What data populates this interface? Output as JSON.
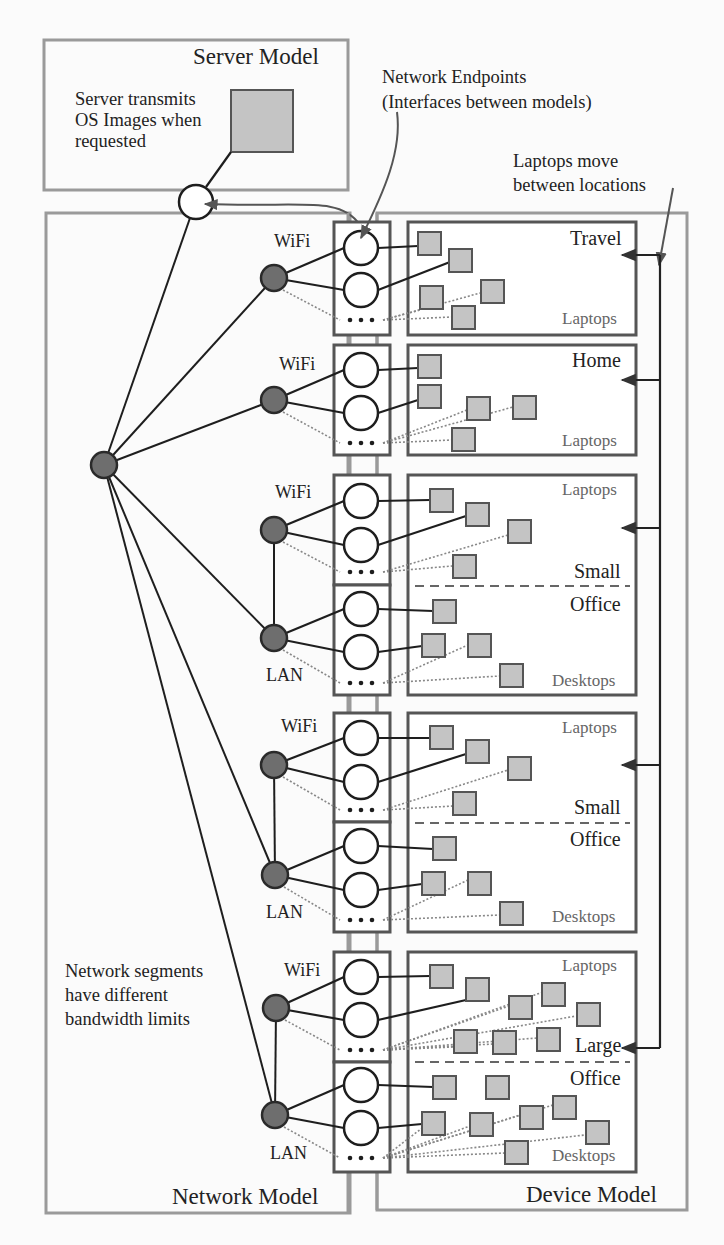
{
  "models": {
    "server": {
      "title": "Server Model",
      "note": [
        "Server transmits",
        "OS Images when",
        "requested"
      ]
    },
    "network": {
      "title": "Network Model",
      "note": [
        "Network segments",
        "have different",
        "bandwidth limits"
      ]
    },
    "device": {
      "title": "Device Model"
    }
  },
  "annotations": {
    "endpoints": [
      "Network Endpoints",
      "(Interfaces between models)"
    ],
    "laptops_move": [
      "Laptops move",
      "between locations"
    ]
  },
  "segment_labels": {
    "wifi": "WiFi",
    "lan": "LAN"
  },
  "locations": [
    {
      "name": "Travel",
      "categories": [
        "Laptops"
      ],
      "segments": [
        "WiFi"
      ]
    },
    {
      "name": "Home",
      "categories": [
        "Laptops"
      ],
      "segments": [
        "WiFi"
      ]
    },
    {
      "name_lines": [
        "Small",
        "Office"
      ],
      "categories": [
        "Laptops",
        "Desktops"
      ],
      "segments": [
        "WiFi",
        "LAN"
      ]
    },
    {
      "name_lines": [
        "Small",
        "Office"
      ],
      "categories": [
        "Laptops",
        "Desktops"
      ],
      "segments": [
        "WiFi",
        "LAN"
      ]
    },
    {
      "name_lines": [
        "Large",
        "Office"
      ],
      "categories": [
        "Laptops",
        "Desktops"
      ],
      "segments": [
        "WiFi",
        "LAN"
      ]
    }
  ],
  "labels": {
    "travel": "Travel",
    "home": "Home",
    "small": "Small",
    "office": "Office",
    "large": "Large",
    "laptops": "Laptops",
    "desktops": "Desktops",
    "ellipsis": "• • •"
  },
  "colors": {
    "frame": "#9a9a9a",
    "box": "#555555",
    "node_fill": "#6e6e6e",
    "device_fill": "#c4c4c4",
    "line": "#1e1e1e"
  }
}
